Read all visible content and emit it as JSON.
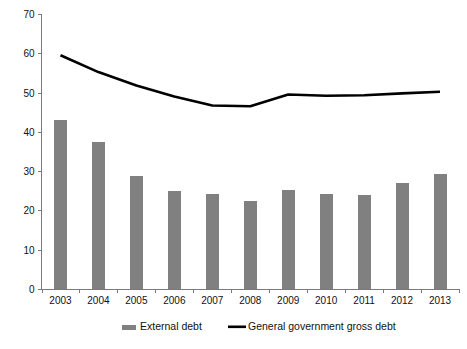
{
  "chart_data": {
    "type": "bar",
    "title": "",
    "subtitle": "",
    "xlabel": "",
    "ylabel": "",
    "ylim": [
      0,
      70
    ],
    "ytick_step": 10,
    "yticks": [
      "0",
      "10",
      "20",
      "30",
      "40",
      "50",
      "60",
      "70"
    ],
    "grid": false,
    "legend_position": "bottom",
    "categories": [
      "2003",
      "2004",
      "2005",
      "2006",
      "2007",
      "2008",
      "2009",
      "2010",
      "2011",
      "2012",
      "2013"
    ],
    "series": [
      {
        "name": "External debt",
        "type": "bar",
        "color": "#808080",
        "values": [
          43.0,
          37.5,
          28.8,
          25.0,
          24.3,
          22.5,
          25.3,
          24.3,
          23.9,
          27.1,
          29.3
        ]
      },
      {
        "name": "General government gross debt",
        "type": "line",
        "color": "#000000",
        "values": [
          59.5,
          55.2,
          51.8,
          49.0,
          46.7,
          46.5,
          49.5,
          49.2,
          49.3,
          49.8,
          50.2
        ]
      }
    ]
  },
  "legend": {
    "items": [
      {
        "label": "External debt",
        "marker": "bar-swatch",
        "color": "#808080"
      },
      {
        "label": "General government gross debt",
        "marker": "line-swatch",
        "color": "#000000"
      }
    ]
  },
  "axis": {
    "y_axis_name": "y-axis",
    "x_axis_name": "x-axis"
  }
}
